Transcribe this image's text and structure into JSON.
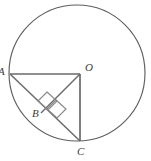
{
  "figure": {
    "type": "geometry-diagram",
    "background_color": "#ffffff",
    "stroke_color": "#6a6a6a",
    "label_color": "#3d3d3d",
    "circle": {
      "center_x": 77,
      "center_y": 73,
      "radius": 68
    },
    "points": {
      "A": {
        "x": 10,
        "y": 74,
        "label": "A"
      },
      "O": {
        "x": 80,
        "y": 74,
        "label": "O"
      },
      "B": {
        "x": 47,
        "y": 104,
        "label": "B"
      },
      "C": {
        "x": 80,
        "y": 141,
        "label": "C"
      }
    },
    "segments": [
      {
        "name": "AO",
        "from": "A",
        "to": "O"
      },
      {
        "name": "OC",
        "from": "O",
        "to": "C"
      },
      {
        "name": "AC",
        "from": "A",
        "to": "C"
      },
      {
        "name": "OB",
        "from": "O",
        "to": "B"
      }
    ],
    "right_angle_marks": [
      {
        "name": "right-angle-upper",
        "at": "B"
      },
      {
        "name": "right-angle-lower",
        "at": "B"
      }
    ]
  }
}
